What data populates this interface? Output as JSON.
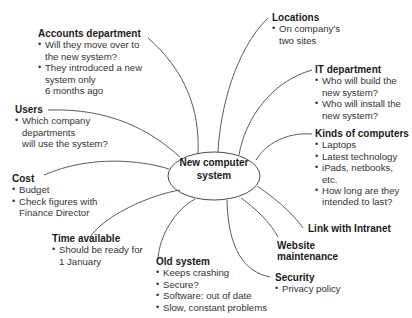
{
  "center": {
    "line1": "New computer",
    "line2": "system"
  },
  "nodes": {
    "accounts": {
      "title": "Accounts department",
      "items": [
        "Will they move over to",
        "the new system?",
        "They introduced a new",
        "system only",
        "6 months ago"
      ]
    },
    "locations": {
      "title": "Locations",
      "items": [
        "On company's",
        "two sites"
      ]
    },
    "it": {
      "title": "IT department",
      "items": [
        "Who will build the",
        "new system?",
        "Who will install the",
        "new system?"
      ]
    },
    "kinds": {
      "title": "Kinds of computers",
      "items": [
        "Laptops",
        "Latest technology",
        "iPads, netbooks,",
        "etc.",
        "How long are they",
        "intended to last?"
      ]
    },
    "users": {
      "title": "Users",
      "items": [
        "Which company",
        "departments",
        "will use the system?"
      ]
    },
    "cost": {
      "title": "Cost",
      "items": [
        "Budget",
        "Check figures with",
        "Finance Director"
      ]
    },
    "time": {
      "title": "Time available",
      "items": [
        "Should be ready for",
        "1 January"
      ]
    },
    "old": {
      "title": "Old system",
      "items": [
        "Keeps crashing",
        "Secure?",
        "Software: out of date",
        "Slow, constant problems"
      ]
    },
    "intranet": {
      "title": "Link with Intranet"
    },
    "website": {
      "title_line1": "Website",
      "title_line2": "maintenance"
    },
    "security": {
      "title": "Security",
      "items": [
        "Privacy policy"
      ]
    }
  },
  "colors": {
    "line": "#4a4a4a",
    "text": "#1e1e1e"
  }
}
